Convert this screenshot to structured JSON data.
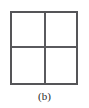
{
  "figure": {
    "caption": "(b)",
    "cropped_top_text": "",
    "colors": {
      "page_background": "#ffffff",
      "square_fill": "#ffffff",
      "square_border": "#555558",
      "divider_line": "#5a5a5e",
      "caption_text": "#2a2a2a",
      "faded_text": "#9a9a9a"
    },
    "square": {
      "x": 10,
      "y": 11,
      "width": 68,
      "height": 74,
      "border_width": 2
    },
    "dividers": {
      "vertical_x": 44,
      "horizontal_y": 48,
      "line_width": 2
    },
    "cells": [
      {
        "name": "top-left",
        "label": ""
      },
      {
        "name": "top-right",
        "label": ""
      },
      {
        "name": "bottom-left",
        "label": ""
      },
      {
        "name": "bottom-right",
        "label": ""
      }
    ]
  }
}
